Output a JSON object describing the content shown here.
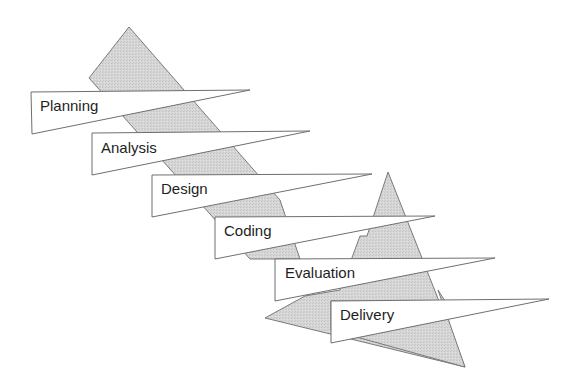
{
  "diagram": {
    "type": "waterfall-phases",
    "colors": {
      "band_fill": "#d4d4d4",
      "band_stroke": "#7a7a7a",
      "banner_fill": "#ffffff",
      "banner_stroke": "#6f6f6f",
      "text": "#1e1e1e"
    },
    "phases": [
      {
        "label": "Planning"
      },
      {
        "label": "Analysis"
      },
      {
        "label": "Design"
      },
      {
        "label": "Coding"
      },
      {
        "label": "Evaluation"
      },
      {
        "label": "Delivery"
      }
    ]
  }
}
